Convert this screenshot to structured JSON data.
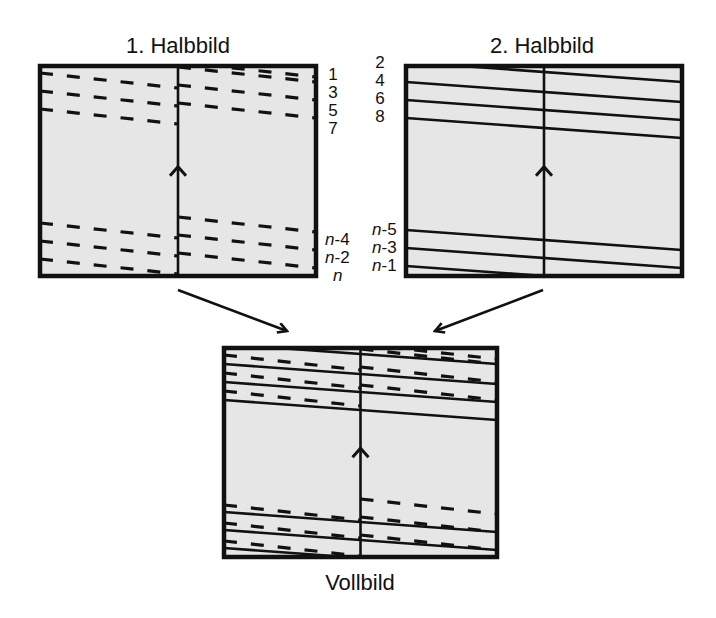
{
  "diagram": {
    "field1": {
      "title": "1. Halbbild",
      "line_labels_top": [
        "1",
        "3",
        "5",
        "7"
      ],
      "line_labels_bottom": [
        {
          "var": "n",
          "suffix": "-4"
        },
        {
          "var": "n",
          "suffix": "-2"
        },
        {
          "var": "n",
          "suffix": ""
        }
      ],
      "line_style": "dashed"
    },
    "field2": {
      "title": "2. Halbbild",
      "line_labels_top": [
        "2",
        "4",
        "6",
        "8"
      ],
      "line_labels_bottom": [
        {
          "var": "n",
          "suffix": "-5"
        },
        {
          "var": "n",
          "suffix": "-3"
        },
        {
          "var": "n",
          "suffix": "-1"
        }
      ],
      "line_style": "solid"
    },
    "frame": {
      "title": "Vollbild",
      "description": "Interlaced combination of odd (dashed) and even (solid) lines"
    },
    "colors": {
      "background": "#e6e6e6",
      "stroke": "#111111"
    }
  }
}
